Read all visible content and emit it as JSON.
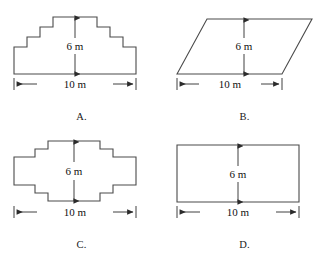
{
  "page": {
    "kind": "multiple-choice-geometry-figures",
    "choices": [
      "A.",
      "B.",
      "C.",
      "D."
    ]
  },
  "labels": {
    "height": "6 m",
    "width": "10 m"
  },
  "colors": {
    "outline": "#4a4a4a",
    "dimension": "#2b2b2b",
    "text": "#111111",
    "background": "#ffffff"
  },
  "figures": [
    {
      "id": "A",
      "choice_label": "A.",
      "shape": "stepped-trapezoid-staircase",
      "height_label": "6 m",
      "width_label": "10 m",
      "outline_points": "14,74 14,47 27,47 27,37 40,37 40,27 53,27 53,17 97,17 97,27 110,27 110,37 123,37 123,47 136,47 136,74",
      "height_dim": {
        "x": 75,
        "y_top": 18,
        "y_bottom": 74
      },
      "width_dim": {
        "y": 84,
        "x_left": 14,
        "x_right": 136
      }
    },
    {
      "id": "B",
      "choice_label": "B.",
      "shape": "parallelogram",
      "height_label": "6 m",
      "width_label": "10 m",
      "outline_points": "14,74 44,19 149,19 119,74",
      "height_dim": {
        "x": 81,
        "y_top": 20,
        "y_bottom": 74
      },
      "width_dim": {
        "y": 84,
        "x_left": 14,
        "x_right": 119
      }
    },
    {
      "id": "C",
      "choice_label": "C.",
      "shape": "stepped-cross-octagon",
      "height_label": "6 m",
      "width_label": "10 m",
      "outline_points": "48,13 100,13 100,21 113,21 113,29 136,29 136,57 113,57 113,65 100,65 100,73 48,73 48,65 35,65 35,57 14,57 14,29 35,29 35,21 48,21",
      "height_dim": {
        "x": 74,
        "y_top": 14,
        "y_bottom": 73
      },
      "width_dim": {
        "y": 84,
        "x_left": 14,
        "x_right": 136
      }
    },
    {
      "id": "D",
      "choice_label": "D.",
      "shape": "rectangle",
      "height_label": "6 m",
      "width_label": "10 m",
      "outline_points": "14,17 136,17 136,74 14,74",
      "height_dim": {
        "x": 75,
        "y_top": 18,
        "y_bottom": 74
      },
      "width_dim": {
        "y": 84,
        "x_left": 14,
        "x_right": 136
      }
    }
  ]
}
